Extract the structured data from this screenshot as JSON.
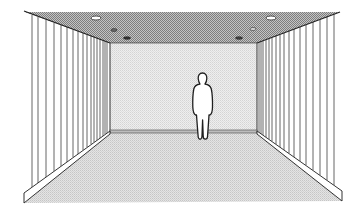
{
  "diagram": {
    "size": {
      "width": 360,
      "height": 218
    },
    "colors": {
      "background": "#ffffff",
      "line": "#2a2a2a",
      "ceiling_dark": "#8f8f8f",
      "ceiling_light": "#c9c9c9",
      "back_wall": "#e6e6e6",
      "floor": "#dcdcdc",
      "side_wall": "#ffffff",
      "figure_fill": "#ffffff"
    },
    "corners": {
      "outer_top_left": [
        24,
        12
      ],
      "outer_top_right": [
        340,
        12
      ],
      "back_top_left": [
        110,
        43
      ],
      "back_top_right": [
        257,
        43
      ],
      "back_bottom_left": [
        109,
        131
      ],
      "back_bottom_right": [
        257,
        131
      ],
      "outer_bottom_left": [
        24,
        203
      ],
      "outer_bottom_right": [
        342,
        201
      ]
    },
    "left_wall_slats_x": [
      32,
      38,
      46,
      54,
      61,
      67,
      73,
      78,
      83,
      87,
      91,
      94,
      97,
      100,
      103,
      105,
      107
    ],
    "right_wall_slats_x": [
      259,
      261,
      263,
      266,
      269,
      272,
      276,
      280,
      284,
      289,
      294,
      300,
      306,
      313,
      320,
      327,
      334
    ],
    "ceiling_lights": [
      {
        "cx": 96,
        "cy": 18,
        "rx": 5,
        "ry": 2,
        "style": "open"
      },
      {
        "cx": 114,
        "cy": 30,
        "rx": 3,
        "ry": 1.5,
        "style": "dark"
      },
      {
        "cx": 127,
        "cy": 38,
        "rx": 3.5,
        "ry": 1.3,
        "style": "dark"
      },
      {
        "cx": 271,
        "cy": 18,
        "rx": 5,
        "ry": 2,
        "style": "open"
      },
      {
        "cx": 253,
        "cy": 29,
        "rx": 3,
        "ry": 1.5,
        "style": "open"
      },
      {
        "cx": 239,
        "cy": 38,
        "rx": 3.5,
        "ry": 1.3,
        "style": "dark"
      }
    ],
    "figure": {
      "label": "standing person silhouette",
      "x": 193,
      "y": 73
    }
  }
}
